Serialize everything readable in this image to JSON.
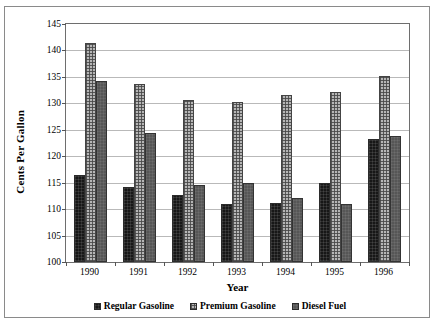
{
  "chart_data": {
    "type": "bar",
    "title": "",
    "xlabel": "Year",
    "ylabel": "Cents Per Gallon",
    "categories": [
      "1990",
      "1991",
      "1992",
      "1993",
      "1994",
      "1995",
      "1996"
    ],
    "ylim": [
      100,
      145
    ],
    "ytick_step": 5,
    "yticks": [
      "100",
      "105",
      "110",
      "115",
      "120",
      "125",
      "130",
      "135",
      "140",
      "145"
    ],
    "grid": true,
    "legend_position": "bottom",
    "series": [
      {
        "name": "Regular Gasoline",
        "color": "#171717",
        "values": [
          116.5,
          114.2,
          112.7,
          111.0,
          111.2,
          114.9,
          123.3
        ]
      },
      {
        "name": "Premium Gasoline",
        "color": "#b6b6b6",
        "values": [
          141.5,
          133.7,
          130.6,
          130.2,
          131.6,
          132.2,
          135.1
        ]
      },
      {
        "name": "Diesel Fuel",
        "color": "#565656",
        "values": [
          134.3,
          124.4,
          114.6,
          114.9,
          112.1,
          111.0,
          123.8
        ]
      }
    ]
  }
}
